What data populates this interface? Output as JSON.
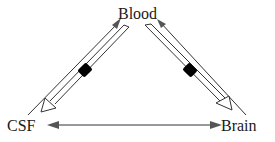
{
  "diagram": {
    "nodes": {
      "blood": "Blood",
      "csf": "CSF",
      "brain": "Brain"
    },
    "edges": [
      {
        "from": "CSF",
        "to": "Blood",
        "style": "thin line, filled arrowhead",
        "barrier": true
      },
      {
        "from": "Blood",
        "to": "CSF",
        "style": "hollow arrow",
        "barrier": true
      },
      {
        "from": "Brain",
        "to": "Blood",
        "style": "thin line, filled arrowhead",
        "barrier": true
      },
      {
        "from": "Blood",
        "to": "Brain",
        "style": "hollow arrow",
        "barrier": true
      },
      {
        "from": "CSF",
        "to": "Brain",
        "style": "double-headed thin arrow",
        "barrier": false
      }
    ],
    "colors": {
      "line": "#333333",
      "arrowhead": "#555555",
      "barrier": "#000000",
      "text": "#1a1a1a"
    }
  }
}
